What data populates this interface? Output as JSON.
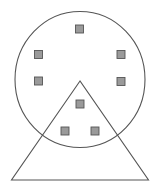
{
  "canvas": {
    "width": 160,
    "height": 193,
    "background": "#ffffff"
  },
  "colors": {
    "stroke": "#555555",
    "square_fill": "#9a9a9a",
    "square_stroke": "#555555"
  },
  "circle": {
    "cx": 80,
    "cy": 79.5,
    "rx": 65,
    "ry": 68,
    "stroke_width": 1.1
  },
  "triangle": {
    "points": [
      [
        80,
        81
      ],
      [
        11.5,
        180
      ],
      [
        148.5,
        180
      ]
    ],
    "stroke_width": 1.1
  },
  "squares": {
    "size": 8,
    "stroke_width": 0.9,
    "items": [
      {
        "id": "top",
        "cx": 79.5,
        "cy": 29
      },
      {
        "id": "upper-left",
        "cx": 38.5,
        "cy": 54.5
      },
      {
        "id": "upper-right",
        "cx": 121,
        "cy": 54.5
      },
      {
        "id": "mid-left",
        "cx": 38.5,
        "cy": 81
      },
      {
        "id": "mid-right",
        "cx": 121,
        "cy": 81.5
      },
      {
        "id": "center-in-triangle",
        "cx": 80,
        "cy": 104
      },
      {
        "id": "lower-left-in-triangle",
        "cx": 65,
        "cy": 131
      },
      {
        "id": "lower-right-in-triangle",
        "cx": 95,
        "cy": 131
      }
    ]
  }
}
